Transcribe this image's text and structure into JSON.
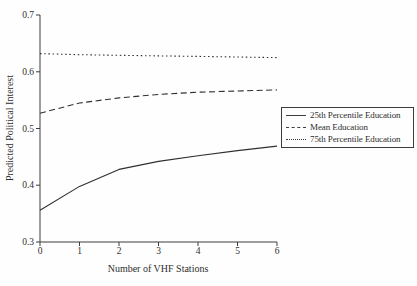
{
  "chart_data": {
    "type": "line",
    "x": [
      0,
      1,
      2,
      3,
      4,
      5,
      6
    ],
    "series": [
      {
        "name": "25th Percentile Education",
        "style": "solid",
        "values": [
          0.356,
          0.398,
          0.428,
          0.442,
          0.452,
          0.461,
          0.469
        ]
      },
      {
        "name": "Mean Education",
        "style": "dashed",
        "values": [
          0.527,
          0.545,
          0.554,
          0.56,
          0.564,
          0.566,
          0.568
        ]
      },
      {
        "name": "75th Percentile Education",
        "style": "dotted",
        "values": [
          0.632,
          0.63,
          0.629,
          0.628,
          0.627,
          0.626,
          0.625
        ]
      }
    ],
    "title": "",
    "xlabel": "Number of VHF Stations",
    "ylabel": "Predicted Political Interest",
    "xlim": [
      0,
      6
    ],
    "ylim": [
      0.3,
      0.7
    ],
    "xticks": [
      0,
      1,
      2,
      3,
      4,
      5,
      6
    ],
    "yticks": [
      0.7,
      0.6,
      0.5,
      0.4,
      0.3
    ],
    "xtick_labels": [
      "0",
      "1",
      "2",
      "3",
      "4",
      "5",
      "6"
    ],
    "ytick_labels": [
      "0.7",
      "0.6",
      "0.5",
      "0.4",
      "0.3"
    ],
    "grid": false,
    "legend_position": "center-right",
    "axis_color": "#3c3c3c",
    "line_color": "#2f2f2f"
  }
}
